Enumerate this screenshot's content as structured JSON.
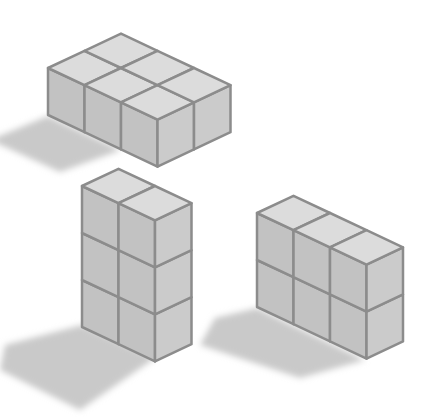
{
  "figure": {
    "colors": {
      "background": "#ffffff",
      "top_face": "#dcdcdc",
      "left_face": "#c2c2c2",
      "right_face": "#cbcbcb",
      "edge": "#8c8c8c",
      "shadow": "#c9c9c9"
    },
    "unit": {
      "ax": 36.5,
      "ay": 17.2,
      "h": 47
    },
    "shapes": [
      {
        "name": "flat-block",
        "label": "2 x 3 x 1",
        "cubes_deep": 2,
        "cubes_wide": 3,
        "cubes_high": 1,
        "origin": [
          48,
          68
        ],
        "shadow": [
          [
            48,
            116
          ],
          [
            121,
            150
          ],
          [
            60,
            172
          ],
          [
            -10,
            140
          ]
        ]
      },
      {
        "name": "tall-tower",
        "label": "1 x 2 x 3",
        "cubes_deep": 1,
        "cubes_wide": 2,
        "cubes_high": 3,
        "origin": [
          82,
          186
        ],
        "shadow": [
          [
            82,
            325
          ],
          [
            155,
            358
          ],
          [
            80,
            410
          ],
          [
            0,
            370
          ],
          [
            5,
            345
          ]
        ]
      },
      {
        "name": "wall-block",
        "label": "1 x 3 x 2",
        "cubes_deep": 1,
        "cubes_wide": 3,
        "cubes_high": 2,
        "origin": [
          257,
          213
        ],
        "shadow": [
          [
            257,
            308
          ],
          [
            365,
            360
          ],
          [
            300,
            378
          ],
          [
            200,
            345
          ],
          [
            215,
            318
          ]
        ]
      }
    ]
  }
}
